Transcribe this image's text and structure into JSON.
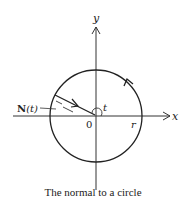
{
  "figure": {
    "caption": "The normal to a circle",
    "labels": {
      "y_axis": "y",
      "x_axis": "x",
      "origin": "0",
      "radius": "r",
      "angle": "t",
      "normal_vector_bold": "N",
      "normal_vector_arg": "(t)"
    }
  },
  "colors": {
    "ink": "#222222",
    "background": "#ffffff"
  }
}
